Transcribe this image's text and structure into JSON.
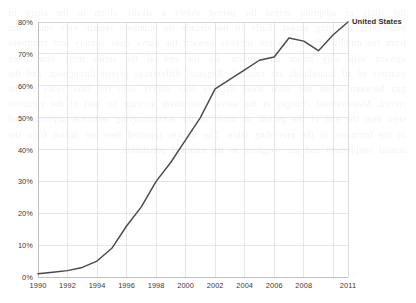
{
  "chart_data": {
    "type": "line",
    "title": "",
    "xlabel": "",
    "ylabel": "",
    "xlim": [
      1990,
      2011
    ],
    "ylim": [
      0,
      80
    ],
    "grid": true,
    "legend_position": "right-of-last-point",
    "x_tick_labels": [
      "1990",
      "1992",
      "1994",
      "1996",
      "1998",
      "2000",
      "2002",
      "2004",
      "2006",
      "2008",
      "2011"
    ],
    "x_tick_values": [
      1990,
      1992,
      1994,
      1996,
      1998,
      2000,
      2002,
      2004,
      2006,
      2008,
      2011
    ],
    "y_tick_labels": [
      "0%",
      "10%",
      "20%",
      "30%",
      "40%",
      "50%",
      "60%",
      "70%",
      "80%"
    ],
    "y_tick_values": [
      0,
      10,
      20,
      30,
      40,
      50,
      60,
      70,
      80
    ],
    "x": [
      1990,
      1991,
      1992,
      1993,
      1994,
      1995,
      1996,
      1997,
      1998,
      1999,
      2000,
      2001,
      2002,
      2003,
      2004,
      2005,
      2006,
      2007,
      2008,
      2009,
      2010,
      2011
    ],
    "series": [
      {
        "name": "United States",
        "color": "#4a4a4a",
        "values": [
          1,
          1.5,
          2,
          3,
          5,
          9,
          16,
          22,
          30,
          36,
          43,
          50,
          59,
          62,
          65,
          68,
          69,
          75,
          74,
          71,
          76,
          80
        ]
      }
    ]
  },
  "legend": {
    "label": "United States"
  },
  "background": {
    "bleed_text": "the study of adoption across the period shows a steady climb in the share of households reporting access. Early in the decade the numbers remain very small, but from the middle of the nineteen nineties onward the curve rises sharply and continues upward with only minor interruption. By the end of the series more than three quarters of all households are counted. Regional differences persist throughout, and the gap between urban and rural areas narrows only slowly over the later years of the record. Measurement changes in the survey instrument account for part of the variation seen near the end of the period, as noted in the accompanying technical appendix and in the footnotes to the preceding table. The figures reported here are drawn from the annual supplement and are weighted to the national population."
  }
}
